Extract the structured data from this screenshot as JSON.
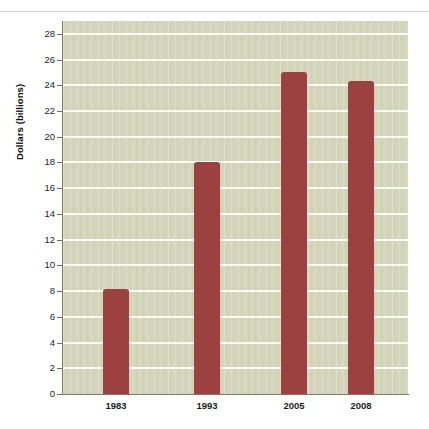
{
  "chart_data": {
    "type": "bar",
    "title": "",
    "subtitle": "",
    "xlabel": "",
    "ylabel": "Dollars (billions)",
    "categories": [
      "1983",
      "1993",
      "2005",
      "2008"
    ],
    "values": [
      8.2,
      18.0,
      25.0,
      24.3
    ],
    "series": [
      {
        "name": "Dollars (billions)",
        "values": [
          8.2,
          18.0,
          25.0,
          24.3
        ]
      }
    ],
    "ylim": [
      0,
      29
    ],
    "y_ticks": [
      0,
      2,
      4,
      6,
      8,
      10,
      12,
      14,
      16,
      18,
      20,
      22,
      24,
      26,
      28
    ],
    "y_tick_labels": [
      "0",
      "2",
      "4",
      "6",
      "8",
      "10",
      "12",
      "14",
      "16",
      "18",
      "20",
      "22",
      "24",
      "26",
      "28"
    ],
    "grid": "horizontal",
    "legend": "none",
    "annotations": [],
    "colors": {
      "bar": "#9c4040",
      "plot_background": "#d4d6bc",
      "gridline": "#fbfbf4",
      "axis": "#7b7b74",
      "text": "#1d1d1d",
      "page_background": "#ffffff",
      "top_rule": "#d8d8d8"
    }
  }
}
